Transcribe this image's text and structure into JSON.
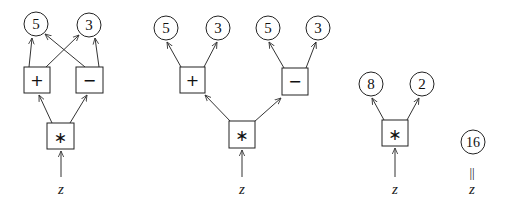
{
  "diagram": {
    "graphs": [
      {
        "id": "shared",
        "leaves": [
          {
            "id": "c5",
            "value": "5"
          },
          {
            "id": "c3",
            "value": "3"
          }
        ],
        "ops": [
          {
            "id": "plus",
            "symbol": "+"
          },
          {
            "id": "minus",
            "symbol": "−"
          },
          {
            "id": "times",
            "symbol": "∗"
          }
        ],
        "input": "z"
      },
      {
        "id": "tree",
        "leaves": [
          {
            "id": "c5a",
            "value": "5"
          },
          {
            "id": "c3a",
            "value": "3"
          },
          {
            "id": "c5b",
            "value": "5"
          },
          {
            "id": "c3b",
            "value": "3"
          }
        ],
        "ops": [
          {
            "id": "plus",
            "symbol": "+"
          },
          {
            "id": "minus",
            "symbol": "−"
          },
          {
            "id": "times",
            "symbol": "∗"
          }
        ],
        "input": "z"
      },
      {
        "id": "reduced",
        "leaves": [
          {
            "id": "c8",
            "value": "8"
          },
          {
            "id": "c2",
            "value": "2"
          }
        ],
        "ops": [
          {
            "id": "times",
            "symbol": "∗"
          }
        ],
        "input": "z"
      },
      {
        "id": "result",
        "leaves": [
          {
            "id": "c16",
            "value": "16"
          }
        ],
        "equals": "||",
        "input": "z"
      }
    ]
  }
}
